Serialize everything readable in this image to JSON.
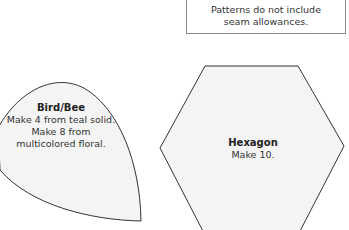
{
  "note": {
    "line1": "Patterns do not include",
    "line2": "seam allowances."
  },
  "shapes": [
    {
      "name": "Bird/Bee",
      "lines": [
        "Make 4 from teal solid.",
        "Make 8 from",
        "multicolored floral."
      ]
    },
    {
      "name": "Hexagon",
      "lines": [
        "Make 10."
      ]
    }
  ],
  "colors": {
    "fill": "#f4f4f4",
    "stroke": "#333333",
    "note_border": "#8a8a8a"
  }
}
